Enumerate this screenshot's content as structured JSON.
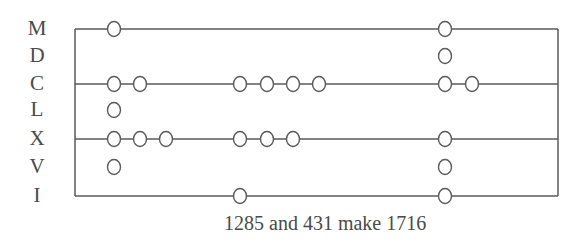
{
  "diagram": {
    "caption": "1285 and 431 make 1716",
    "colors": {
      "line": "#5a5a5a",
      "text": "#4a4a4a",
      "background": "#ffffff"
    },
    "frame": {
      "left": 75,
      "right": 558,
      "top": 29,
      "bottom": 196
    },
    "rows": [
      {
        "label": "M",
        "value": 1000,
        "y": 29,
        "ruled": true
      },
      {
        "label": "D",
        "value": 500,
        "y": 56,
        "ruled": false
      },
      {
        "label": "C",
        "value": 100,
        "y": 84,
        "ruled": true
      },
      {
        "label": "L",
        "value": 50,
        "y": 110,
        "ruled": false
      },
      {
        "label": "X",
        "value": 10,
        "y": 139,
        "ruled": true
      },
      {
        "label": "V",
        "value": 5,
        "y": 167,
        "ruled": false
      },
      {
        "label": "I",
        "value": 1,
        "y": 196,
        "ruled": true
      }
    ],
    "columns": [
      {
        "name": "1285",
        "counters": [
          {
            "row": "M",
            "x": [
              114
            ]
          },
          {
            "row": "C",
            "x": [
              114,
              140
            ]
          },
          {
            "row": "L",
            "x": [
              114
            ]
          },
          {
            "row": "X",
            "x": [
              114,
              140,
              166
            ]
          },
          {
            "row": "V",
            "x": [
              114
            ]
          }
        ]
      },
      {
        "name": "431",
        "counters": [
          {
            "row": "C",
            "x": [
              240,
              267,
              293,
              319
            ]
          },
          {
            "row": "X",
            "x": [
              240,
              267,
              293
            ]
          },
          {
            "row": "I",
            "x": [
              240
            ]
          }
        ]
      },
      {
        "name": "1716",
        "counters": [
          {
            "row": "M",
            "x": [
              445
            ]
          },
          {
            "row": "D",
            "x": [
              445
            ]
          },
          {
            "row": "C",
            "x": [
              445,
              472
            ]
          },
          {
            "row": "X",
            "x": [
              445
            ]
          },
          {
            "row": "V",
            "x": [
              445
            ]
          },
          {
            "row": "I",
            "x": [
              445
            ]
          }
        ]
      }
    ]
  }
}
